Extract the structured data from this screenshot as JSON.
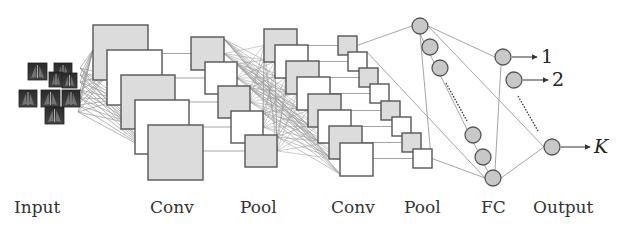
{
  "diagram": {
    "colors": {
      "square_border": "#555555",
      "square_fill_gray": "#dcdcdc",
      "square_fill_white": "#ffffff",
      "connection_line": "#9a9a9a",
      "node_fill": "#c8c8c8",
      "node_border": "#555555",
      "label_text": "#333333"
    },
    "stages": [
      {
        "id": "input",
        "label": "Input",
        "label_x": 14
      },
      {
        "id": "conv1",
        "label": "Conv",
        "label_x": 150
      },
      {
        "id": "pool1",
        "label": "Pool",
        "label_x": 240
      },
      {
        "id": "conv2",
        "label": "Conv",
        "label_x": 331
      },
      {
        "id": "pool2",
        "label": "Pool",
        "label_x": 404
      },
      {
        "id": "fc",
        "label": "FC",
        "label_x": 481
      },
      {
        "id": "output",
        "label": "Output",
        "label_x": 533
      }
    ],
    "input_images": [
      {
        "x": 28,
        "y": 63,
        "w": 19,
        "h": 17
      },
      {
        "x": 54,
        "y": 63,
        "w": 18,
        "h": 16
      },
      {
        "x": 49,
        "y": 72,
        "w": 14,
        "h": 15
      },
      {
        "x": 62,
        "y": 73,
        "w": 15,
        "h": 15
      },
      {
        "x": 19,
        "y": 90,
        "w": 18,
        "h": 17
      },
      {
        "x": 41,
        "y": 90,
        "w": 19,
        "h": 17
      },
      {
        "x": 62,
        "y": 90,
        "w": 18,
        "h": 17
      },
      {
        "x": 45,
        "y": 107,
        "w": 19,
        "h": 17
      }
    ],
    "conv1_maps": [
      {
        "x": 93,
        "y": 25,
        "s": 55,
        "fill": "gray"
      },
      {
        "x": 107,
        "y": 50,
        "s": 55,
        "fill": "white"
      },
      {
        "x": 121,
        "y": 75,
        "s": 54,
        "fill": "gray"
      },
      {
        "x": 135,
        "y": 100,
        "s": 54,
        "fill": "white"
      },
      {
        "x": 148,
        "y": 125,
        "s": 55,
        "fill": "gray"
      }
    ],
    "pool1_maps": [
      {
        "x": 191,
        "y": 37,
        "s": 33,
        "fill": "gray"
      },
      {
        "x": 205,
        "y": 62,
        "s": 32,
        "fill": "white"
      },
      {
        "x": 218,
        "y": 86,
        "s": 32,
        "fill": "gray"
      },
      {
        "x": 231,
        "y": 111,
        "s": 32,
        "fill": "white"
      },
      {
        "x": 245,
        "y": 135,
        "s": 32,
        "fill": "gray"
      }
    ],
    "conv2_maps": [
      {
        "x": 264,
        "y": 29,
        "s": 33,
        "fill": "gray"
      },
      {
        "x": 275,
        "y": 45,
        "s": 33,
        "fill": "white"
      },
      {
        "x": 286,
        "y": 61,
        "s": 33,
        "fill": "gray"
      },
      {
        "x": 297,
        "y": 77,
        "s": 33,
        "fill": "white"
      },
      {
        "x": 308,
        "y": 94,
        "s": 33,
        "fill": "gray"
      },
      {
        "x": 318,
        "y": 110,
        "s": 33,
        "fill": "white"
      },
      {
        "x": 329,
        "y": 126,
        "s": 33,
        "fill": "gray"
      },
      {
        "x": 340,
        "y": 143,
        "s": 33,
        "fill": "white"
      }
    ],
    "pool2_maps": [
      {
        "x": 338,
        "y": 36,
        "s": 19,
        "fill": "gray"
      },
      {
        "x": 348,
        "y": 52,
        "s": 19,
        "fill": "white"
      },
      {
        "x": 359,
        "y": 68,
        "s": 19,
        "fill": "gray"
      },
      {
        "x": 370,
        "y": 84,
        "s": 19,
        "fill": "white"
      },
      {
        "x": 381,
        "y": 101,
        "s": 19,
        "fill": "gray"
      },
      {
        "x": 392,
        "y": 117,
        "s": 19,
        "fill": "white"
      },
      {
        "x": 402,
        "y": 133,
        "s": 19,
        "fill": "gray"
      },
      {
        "x": 413,
        "y": 149,
        "s": 19,
        "fill": "white"
      }
    ],
    "fc_nodes": [
      {
        "cx": 420,
        "cy": 26
      },
      {
        "cx": 430,
        "cy": 47
      },
      {
        "cx": 440,
        "cy": 68
      },
      {
        "cx": 473,
        "cy": 135
      },
      {
        "cx": 483,
        "cy": 157
      },
      {
        "cx": 493,
        "cy": 178
      }
    ],
    "output_nodes": [
      {
        "cx": 503,
        "cy": 57,
        "label": "1",
        "italic": false
      },
      {
        "cx": 514,
        "cy": 80,
        "label": "2",
        "italic": false
      },
      {
        "cx": 552,
        "cy": 147,
        "label": "K",
        "italic": true
      }
    ],
    "node_radius": 8
  }
}
